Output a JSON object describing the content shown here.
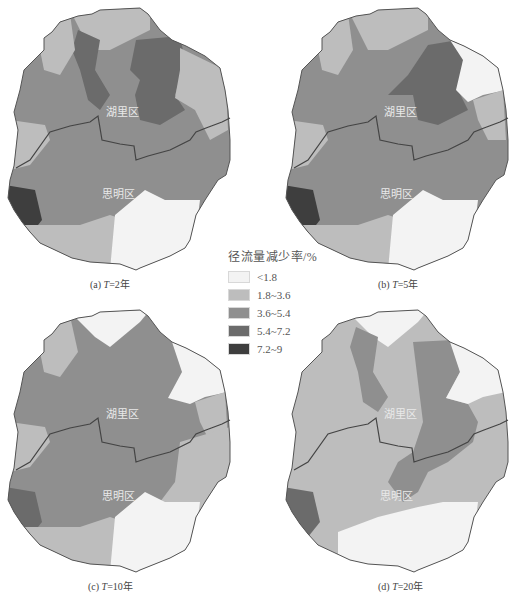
{
  "legend": {
    "title": "径流量减少率/%",
    "classes": [
      {
        "label": "<1.8",
        "color": "#f3f3f3"
      },
      {
        "label": "1.8~3.6",
        "color": "#bdbdbd"
      },
      {
        "label": "3.6~5.4",
        "color": "#8f8f8f"
      },
      {
        "label": "5.4~7.2",
        "color": "#6b6b6b"
      },
      {
        "label": "7.2~9",
        "color": "#3e3e3e"
      }
    ]
  },
  "districts": {
    "north": "湖里区",
    "south": "思明区"
  },
  "panels": [
    {
      "id": "a",
      "caption_prefix": "(a) ",
      "caption_var": "T",
      "caption_value": "=2年"
    },
    {
      "id": "b",
      "caption_prefix": "(b) ",
      "caption_var": "T",
      "caption_value": "=5年"
    },
    {
      "id": "c",
      "caption_prefix": "(c) ",
      "caption_var": "T",
      "caption_value": "=10年"
    },
    {
      "id": "d",
      "caption_prefix": "(d) ",
      "caption_var": "T",
      "caption_value": "=20年"
    }
  ]
}
